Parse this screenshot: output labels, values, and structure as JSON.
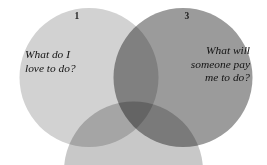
{
  "diagram": {
    "type": "venn",
    "background_color": "#ffffff",
    "circles": [
      {
        "id": "circle-1",
        "number": "1",
        "fill": "#d2d2d2",
        "caption_lines": [
          "What do I",
          "love to do?"
        ],
        "visible": "full"
      },
      {
        "id": "circle-2",
        "number": "",
        "fill": "#c3c3c3",
        "caption_lines": [],
        "visible": "cropped-bottom"
      },
      {
        "id": "circle-3",
        "number": "3",
        "fill": "#9b9b9b",
        "caption_lines": [
          "What will",
          "someone pay",
          "me to do?"
        ],
        "visible": "full"
      }
    ],
    "overlap_color": "#6f6f6f",
    "text_color": "#121212"
  }
}
